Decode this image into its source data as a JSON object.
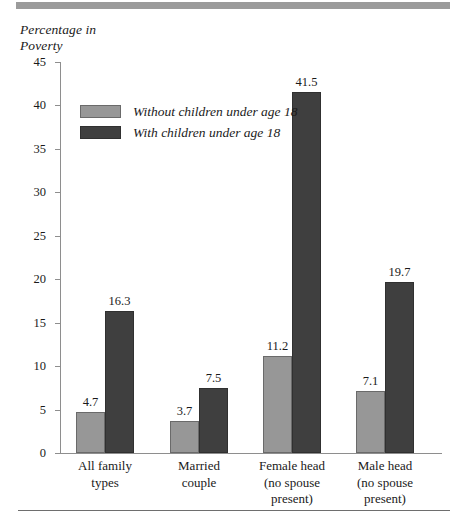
{
  "chart_data": {
    "type": "bar",
    "title": "",
    "subtitle": "",
    "xlabel": "",
    "ylabel": "Percentage in\nPoverty",
    "ylim": [
      0,
      45
    ],
    "ytick_step": 5,
    "yticks": [
      "45",
      "40",
      "35",
      "30",
      "25",
      "20",
      "15",
      "10",
      "5",
      "0"
    ],
    "grid": false,
    "legend_position": "upper-left-inside",
    "categories": [
      "All family\ntypes",
      "Married\ncouple",
      "Female head\n(no spouse\npresent)",
      "Male head\n(no spouse\npresent)"
    ],
    "series": [
      {
        "name": "Without children under age 18",
        "color": "#979797",
        "values": [
          4.7,
          3.7,
          11.2,
          7.1
        ],
        "labels": [
          "4.7",
          "3.7",
          "11.2",
          "7.1"
        ]
      },
      {
        "name": "With children under age 18",
        "color": "#3f3f3f",
        "values": [
          16.3,
          7.5,
          41.5,
          19.7
        ],
        "labels": [
          "16.3",
          "7.5",
          "41.5",
          "19.7"
        ]
      }
    ]
  },
  "colors": {
    "light_bar": "#979797",
    "dark_bar": "#3f3f3f",
    "axis": "#8e8e8e",
    "top_rule": "#9b9b9b",
    "bottom_rule": "#6e6e6e",
    "text": "#1a1a1a"
  }
}
